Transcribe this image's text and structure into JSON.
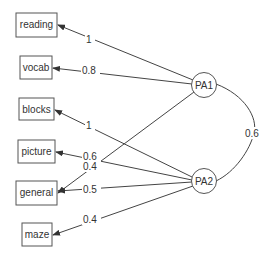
{
  "diagram": {
    "type": "factor-analysis-path-diagram",
    "observed": [
      {
        "id": "reading",
        "label": "reading"
      },
      {
        "id": "vocab",
        "label": "vocab"
      },
      {
        "id": "blocks",
        "label": "blocks"
      },
      {
        "id": "picture",
        "label": "picture"
      },
      {
        "id": "general",
        "label": "general"
      },
      {
        "id": "maze",
        "label": "maze"
      }
    ],
    "latent": [
      {
        "id": "PA1",
        "label": "PA1"
      },
      {
        "id": "PA2",
        "label": "PA2"
      }
    ],
    "loadings": [
      {
        "from": "PA1",
        "to": "reading",
        "label": "1"
      },
      {
        "from": "PA1",
        "to": "vocab",
        "label": "0.8"
      },
      {
        "from": "PA1",
        "to": "general",
        "label": "0.4"
      },
      {
        "from": "PA2",
        "to": "blocks",
        "label": "1"
      },
      {
        "from": "PA2",
        "to": "picture",
        "label": "0.6"
      },
      {
        "from": "PA2",
        "to": "general",
        "label": "0.5"
      },
      {
        "from": "PA2",
        "to": "maze",
        "label": "0.4"
      }
    ],
    "correlation": {
      "between": [
        "PA1",
        "PA2"
      ],
      "label": "0.6"
    }
  }
}
